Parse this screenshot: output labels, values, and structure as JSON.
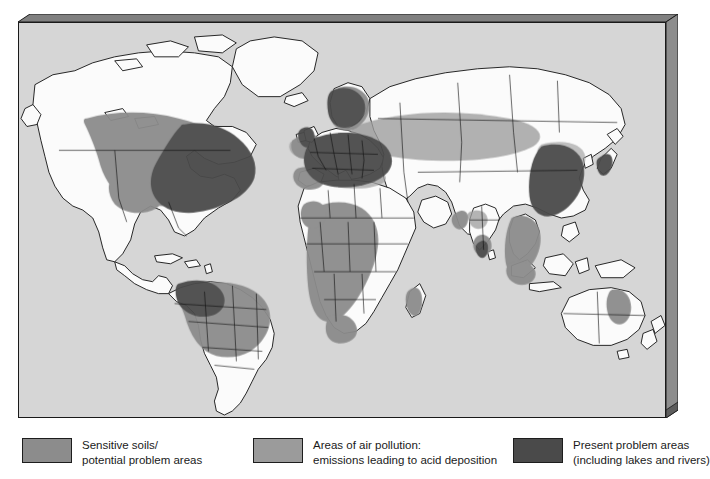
{
  "figure": {
    "name": "world-acid-deposition-map",
    "frame": {
      "plate_fill": "#d6d6d6",
      "bevel_dark": "#6e6e6e",
      "bevel_light": "#c9c9c9",
      "outline": "#1a1a1a"
    }
  },
  "map": {
    "ocean_color": "#d6d6d6",
    "land_color": "#fbfbfb",
    "coastline_color": "#111111",
    "border_color": "#111111",
    "categories": {
      "sensitive": {
        "label": "Sensitive soils/potential problem areas",
        "color": "#8c8c8c"
      },
      "pollution": {
        "label": "Areas of air pollution: emissions leading to acid deposition",
        "color": "#9b9b9b"
      },
      "present": {
        "label": "Present problem areas (including lakes and rivers)",
        "color": "#4a4a4a"
      }
    },
    "regions": [
      {
        "name": "north-america-sensitive-belt",
        "category": "sensitive"
      },
      {
        "name": "eastern-north-america-present",
        "category": "present"
      },
      {
        "name": "northern-europe-present",
        "category": "present"
      },
      {
        "name": "central-europe-present",
        "category": "present"
      },
      {
        "name": "western-europe-sensitive",
        "category": "sensitive"
      },
      {
        "name": "eurasia-pollution-plume",
        "category": "pollution"
      },
      {
        "name": "eastern-china-present",
        "category": "present"
      },
      {
        "name": "southeast-asia-sensitive",
        "category": "sensitive"
      },
      {
        "name": "south-america-sensitive",
        "category": "sensitive"
      },
      {
        "name": "amazon-present",
        "category": "present"
      },
      {
        "name": "central-africa-sensitive",
        "category": "sensitive"
      },
      {
        "name": "australia-east-sensitive",
        "category": "sensitive"
      },
      {
        "name": "india-pollution",
        "category": "pollution"
      }
    ]
  },
  "legend": {
    "items": [
      {
        "swatch_color": "#8c8c8c",
        "line1": "Sensitive soils/",
        "line2": "potential problem areas"
      },
      {
        "swatch_color": "#9b9b9b",
        "line1": "Areas of air pollution:",
        "line2": "emissions leading to acid deposition"
      },
      {
        "swatch_color": "#4a4a4a",
        "line1": "Present problem areas",
        "line2": "(including lakes and rivers)"
      }
    ]
  }
}
